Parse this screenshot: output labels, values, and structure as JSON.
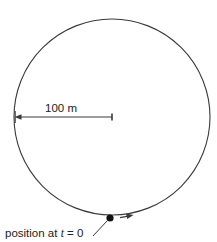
{
  "figure": {
    "name": "circular-track-diagram",
    "background_color": "#ffffff",
    "stroke_color": "#3a3a3a",
    "text_color": "#222222"
  },
  "track": {
    "shape": "circle",
    "center_x": 112,
    "center_y": 117,
    "radius_px": 98
  },
  "radius_annotation": {
    "label": "100 m",
    "value": 100,
    "unit": "m",
    "from_x": 15,
    "to_x": 112,
    "y": 117
  },
  "start_marker": {
    "label_prefix": "position at ",
    "label_variable": "t",
    "label_suffix": " = 0",
    "label_full": "position at t = 0",
    "dot_x": 110,
    "dot_y": 218,
    "dot_radius": 3.6
  },
  "direction_arrow": {
    "name": "motion-direction-arrow",
    "description": "arrowhead on circle indicating direction of travel"
  }
}
